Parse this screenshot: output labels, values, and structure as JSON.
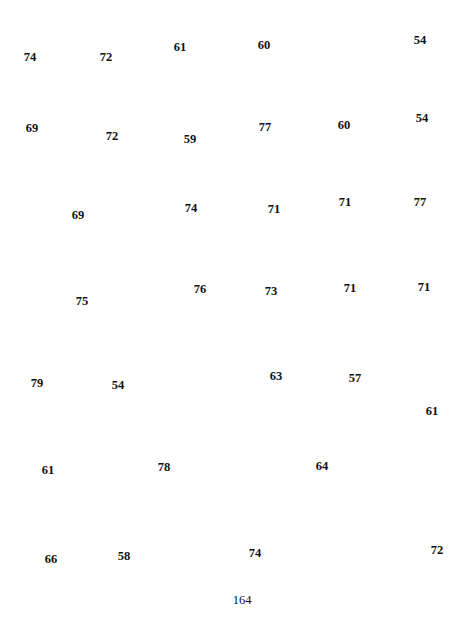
{
  "page": {
    "page_number": "164",
    "numbers": [
      {
        "value": "74",
        "x": 30,
        "y": 57
      },
      {
        "value": "72",
        "x": 106,
        "y": 57
      },
      {
        "value": "61",
        "x": 180,
        "y": 47
      },
      {
        "value": "60",
        "x": 264,
        "y": 45
      },
      {
        "value": "54",
        "x": 420,
        "y": 40
      },
      {
        "value": "69",
        "x": 32,
        "y": 128
      },
      {
        "value": "72",
        "x": 112,
        "y": 136
      },
      {
        "value": "59",
        "x": 190,
        "y": 139
      },
      {
        "value": "77",
        "x": 265,
        "y": 127
      },
      {
        "value": "60",
        "x": 344,
        "y": 125
      },
      {
        "value": "54",
        "x": 422,
        "y": 118
      },
      {
        "value": "69",
        "x": 78,
        "y": 215
      },
      {
        "value": "74",
        "x": 191,
        "y": 208
      },
      {
        "value": "71",
        "x": 274,
        "y": 209
      },
      {
        "value": "71",
        "x": 345,
        "y": 202
      },
      {
        "value": "77",
        "x": 420,
        "y": 202
      },
      {
        "value": "75",
        "x": 82,
        "y": 301
      },
      {
        "value": "76",
        "x": 200,
        "y": 289
      },
      {
        "value": "73",
        "x": 271,
        "y": 291
      },
      {
        "value": "71",
        "x": 350,
        "y": 288
      },
      {
        "value": "71",
        "x": 424,
        "y": 287
      },
      {
        "value": "79",
        "x": 37,
        "y": 383
      },
      {
        "value": "54",
        "x": 118,
        "y": 385
      },
      {
        "value": "63",
        "x": 276,
        "y": 376
      },
      {
        "value": "57",
        "x": 355,
        "y": 378
      },
      {
        "value": "61",
        "x": 432,
        "y": 411
      },
      {
        "value": "61",
        "x": 48,
        "y": 470
      },
      {
        "value": "78",
        "x": 164,
        "y": 467
      },
      {
        "value": "64",
        "x": 322,
        "y": 466
      },
      {
        "value": "66",
        "x": 51,
        "y": 559
      },
      {
        "value": "58",
        "x": 124,
        "y": 556
      },
      {
        "value": "74",
        "x": 255,
        "y": 553
      },
      {
        "value": "72",
        "x": 437,
        "y": 550
      }
    ]
  }
}
